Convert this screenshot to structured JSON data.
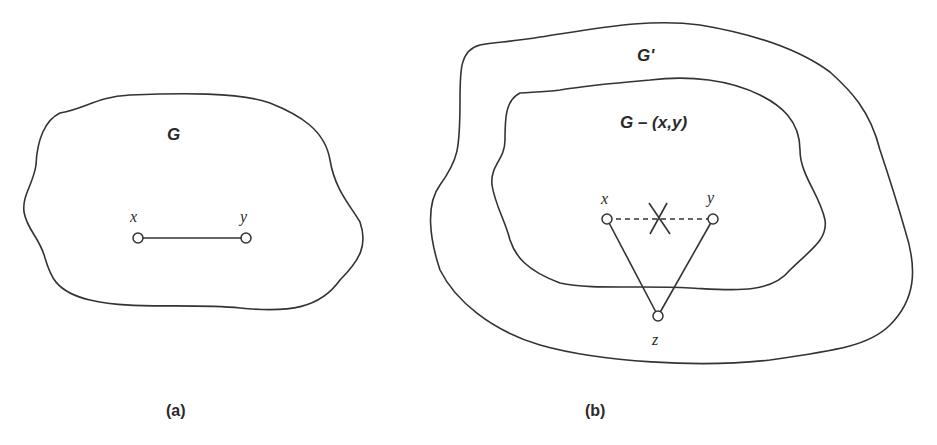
{
  "figure": {
    "panel_a": {
      "caption": "(a)",
      "region_label": "G",
      "nodes": [
        {
          "id": "x",
          "label": "x"
        },
        {
          "id": "y",
          "label": "y"
        }
      ],
      "edges": [
        {
          "from": "x",
          "to": "y",
          "style": "solid"
        }
      ]
    },
    "panel_b": {
      "caption": "(b)",
      "outer_region_label": "G'",
      "inner_region_label": "G – (x,y)",
      "nodes": [
        {
          "id": "x",
          "label": "x"
        },
        {
          "id": "y",
          "label": "y"
        },
        {
          "id": "z",
          "label": "z"
        }
      ],
      "edges": [
        {
          "from": "x",
          "to": "y",
          "style": "dashed",
          "removed": true
        },
        {
          "from": "x",
          "to": "z",
          "style": "solid"
        },
        {
          "from": "y",
          "to": "z",
          "style": "solid"
        }
      ]
    }
  }
}
